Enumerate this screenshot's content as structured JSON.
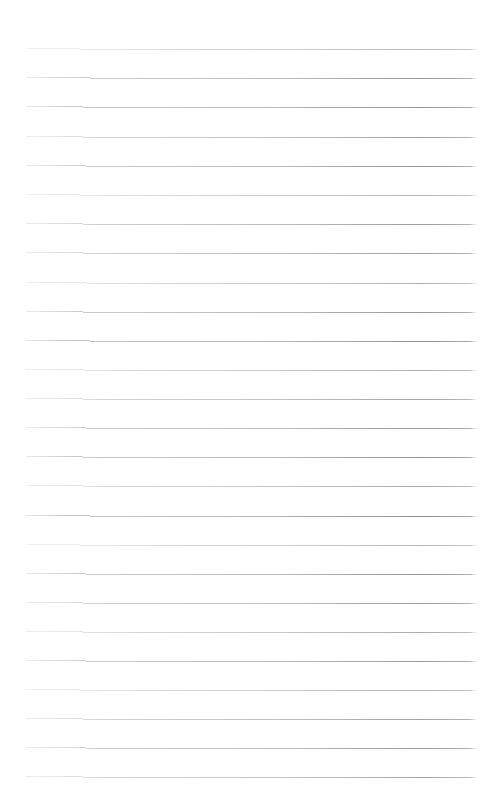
{
  "document": {
    "kind": "scanned-ruled-notebook-page",
    "title": "Blank Ruled Notebook Page",
    "page_width": 494,
    "page_height": 812,
    "background_color": "#ffffff",
    "text_content": "",
    "has_visible_text": false,
    "has_handwriting": false,
    "page_number_label": ""
  },
  "ruling": {
    "line_count": 26,
    "first_line_y": 49,
    "line_spacing": 29.1,
    "last_line_y": 777,
    "line_left_x": 26,
    "line_right_x": 477,
    "line_length": 451,
    "line_thickness": 1,
    "line_color": "#a8a8ac",
    "line_color_dark": "#8d8d93",
    "line_color_light": "#cfcfd4",
    "slant_degrees": 0.35,
    "style": "horizontal-ruled",
    "margins": {
      "top": 48,
      "bottom": 32,
      "left": 26,
      "right": 17
    },
    "lines": [
      {
        "index": 1,
        "y": 49,
        "opacity": 0.55,
        "slant": 2.6,
        "fade_start": 0.34
      },
      {
        "index": 2,
        "y": 78,
        "opacity": 0.78,
        "slant": 2.2,
        "fade_start": 0.12
      },
      {
        "index": 3,
        "y": 107,
        "opacity": 0.82,
        "slant": 2.4,
        "fade_start": 0.1
      },
      {
        "index": 4,
        "y": 137,
        "opacity": 0.72,
        "slant": 2.5,
        "fade_start": 0.22
      },
      {
        "index": 5,
        "y": 166,
        "opacity": 0.8,
        "slant": 2.3,
        "fade_start": 0.14
      },
      {
        "index": 6,
        "y": 195,
        "opacity": 0.58,
        "slant": 2.6,
        "fade_start": 0.3
      },
      {
        "index": 7,
        "y": 224,
        "opacity": 0.76,
        "slant": 2.4,
        "fade_start": 0.16
      },
      {
        "index": 8,
        "y": 253,
        "opacity": 0.74,
        "slant": 2.5,
        "fade_start": 0.18
      },
      {
        "index": 9,
        "y": 283,
        "opacity": 0.6,
        "slant": 2.3,
        "fade_start": 0.28
      },
      {
        "index": 10,
        "y": 312,
        "opacity": 0.8,
        "slant": 2.4,
        "fade_start": 0.12
      },
      {
        "index": 11,
        "y": 341,
        "opacity": 0.84,
        "slant": 2.2,
        "fade_start": 0.08
      },
      {
        "index": 12,
        "y": 370,
        "opacity": 0.62,
        "slant": 2.5,
        "fade_start": 0.26
      },
      {
        "index": 13,
        "y": 399,
        "opacity": 0.7,
        "slant": 2.4,
        "fade_start": 0.2
      },
      {
        "index": 14,
        "y": 428,
        "opacity": 0.78,
        "slant": 2.3,
        "fade_start": 0.14
      },
      {
        "index": 15,
        "y": 457,
        "opacity": 0.82,
        "slant": 2.5,
        "fade_start": 0.1
      },
      {
        "index": 16,
        "y": 486,
        "opacity": 0.66,
        "slant": 2.4,
        "fade_start": 0.24
      },
      {
        "index": 17,
        "y": 516,
        "opacity": 0.86,
        "slant": 2.2,
        "fade_start": 0.08
      },
      {
        "index": 18,
        "y": 545,
        "opacity": 0.56,
        "slant": 2.6,
        "fade_start": 0.32
      },
      {
        "index": 19,
        "y": 574,
        "opacity": 0.8,
        "slant": 2.3,
        "fade_start": 0.12
      },
      {
        "index": 20,
        "y": 603,
        "opacity": 0.74,
        "slant": 2.4,
        "fade_start": 0.18
      },
      {
        "index": 21,
        "y": 632,
        "opacity": 0.64,
        "slant": 2.5,
        "fade_start": 0.26
      },
      {
        "index": 22,
        "y": 661,
        "opacity": 0.78,
        "slant": 2.3,
        "fade_start": 0.14
      },
      {
        "index": 23,
        "y": 690,
        "opacity": 0.58,
        "slant": 2.6,
        "fade_start": 0.3
      },
      {
        "index": 24,
        "y": 719,
        "opacity": 0.72,
        "slant": 2.4,
        "fade_start": 0.2
      },
      {
        "index": 25,
        "y": 748,
        "opacity": 0.76,
        "slant": 2.3,
        "fade_start": 0.16
      },
      {
        "index": 26,
        "y": 777,
        "opacity": 0.68,
        "slant": 2.5,
        "fade_start": 0.22
      }
    ]
  }
}
